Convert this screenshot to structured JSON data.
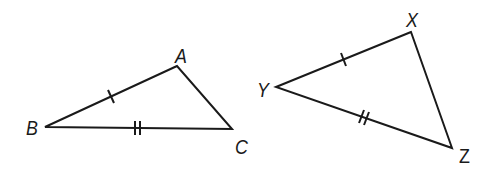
{
  "diagram": {
    "stroke_color": "#1a1a1a",
    "triangles": [
      {
        "name": "ABC",
        "vertices": {
          "A": {
            "label": "A",
            "x": 177,
            "y": 66,
            "label_x": 175,
            "label_y": 44
          },
          "B": {
            "label": "B",
            "x": 45,
            "y": 127,
            "label_x": 26,
            "label_y": 117
          },
          "C": {
            "label": "C",
            "x": 232,
            "y": 129,
            "label_x": 235,
            "label_y": 136
          }
        },
        "tick_marks": [
          {
            "side": "AB",
            "count": 1
          },
          {
            "side": "BC",
            "count": 2
          }
        ]
      },
      {
        "name": "XYZ",
        "vertices": {
          "X": {
            "label": "X",
            "x": 411,
            "y": 32,
            "label_x": 406,
            "label_y": 9
          },
          "Y": {
            "label": "Y",
            "x": 276,
            "y": 87,
            "label_x": 257,
            "label_y": 79
          },
          "Z": {
            "label": "Z",
            "x": 452,
            "y": 148,
            "label_x": 459,
            "label_y": 145
          }
        },
        "tick_marks": [
          {
            "side": "XY",
            "count": 1
          },
          {
            "side": "YZ",
            "count": 2
          }
        ]
      }
    ]
  }
}
